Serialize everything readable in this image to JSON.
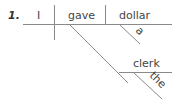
{
  "diagram": {
    "number": "1.",
    "subject": "I",
    "verb": "gave",
    "direct_object": "dollar",
    "direct_object_modifier": "a",
    "indirect_object": "clerk",
    "indirect_object_modifier": "the"
  }
}
